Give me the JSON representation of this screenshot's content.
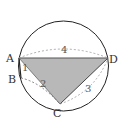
{
  "diagram": {
    "type": "inscribed quadrilateral in circle",
    "points": {
      "A": {
        "label": "A"
      },
      "B": {
        "label": "B"
      },
      "C": {
        "label": "C"
      },
      "D": {
        "label": "D"
      }
    },
    "lengths": {
      "AB": "1",
      "BC": "2",
      "CD": "3",
      "AD": "4"
    },
    "shaded_region": "triangle ACD",
    "colors": {
      "circle": "#222222",
      "shade": "#b5b5b5",
      "dashed": "#999999",
      "text": "#333333"
    }
  }
}
